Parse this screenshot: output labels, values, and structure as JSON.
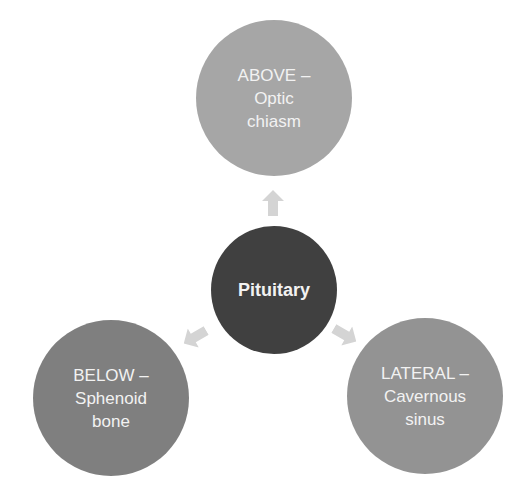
{
  "diagram": {
    "type": "radial-cycle",
    "center": {
      "label": "Pituitary",
      "color": "#404040"
    },
    "nodes": [
      {
        "id": "above",
        "lines": [
          "ABOVE –",
          "Optic",
          "chiasm"
        ],
        "color": "#a6a6a6"
      },
      {
        "id": "below",
        "lines": [
          "BELOW –",
          "Sphenoid",
          "bone"
        ],
        "color": "#7f7f7f"
      },
      {
        "id": "lateral",
        "lines": [
          "LATERAL –",
          "Cavernous",
          "sinus"
        ],
        "color": "#939393"
      }
    ],
    "arrow_color": "#d4d4d4",
    "text_color": "#f2f2f2"
  }
}
